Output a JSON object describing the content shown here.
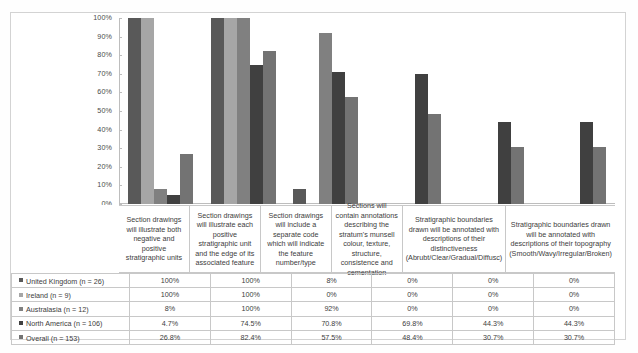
{
  "chart_data": {
    "type": "bar",
    "title": "",
    "xlabel": "",
    "ylabel": "",
    "ylim": [
      0,
      100
    ],
    "grid": false,
    "legend_position": "table-left-column",
    "y_ticks": [
      "0%",
      "10%",
      "20%",
      "30%",
      "40%",
      "50%",
      "60%",
      "70%",
      "80%",
      "90%",
      "100%"
    ],
    "categories": [
      "Section drawings will illustrate both negative and positive stratigraphic units",
      "Section drawings will illustrate each positive stratigraphic unit and the edge of its associated feature",
      "Section drawings will include a separate code which will indicate the feature number/type",
      "Sections will contain annotations describing the stratum's munsell colour, texture, structure, consistence and cementation",
      "Stratigraphic boundaries drawn will be annotated with descriptions of their distinctiveness (Abrubt/Clear/Gradual/Diffusc)",
      "Stratigraphic boundaries drawn will be annotated with descriptions of their topography (Smooth/Wavy/Irregular/Broken)"
    ],
    "series": [
      {
        "name": "United Kingdom (n = 26)",
        "color": "#595959",
        "values": [
          100,
          100,
          8,
          0,
          0,
          0
        ],
        "labels": [
          "100%",
          "100%",
          "8%",
          "0%",
          "0%",
          "0%"
        ]
      },
      {
        "name": "Ireland (n = 9)",
        "color": "#a6a6a6",
        "values": [
          100,
          100,
          0,
          0,
          0,
          0
        ],
        "labels": [
          "100%",
          "100%",
          "0%",
          "0%",
          "0%",
          "0%"
        ]
      },
      {
        "name": "Australasia (n = 12)",
        "color": "#808080",
        "values": [
          8,
          100,
          92,
          0,
          0,
          0
        ],
        "labels": [
          "8%",
          "100%",
          "92%",
          "0%",
          "0%",
          "0%"
        ]
      },
      {
        "name": "North America (n = 106)",
        "color": "#404040",
        "values": [
          4.7,
          74.5,
          70.8,
          69.8,
          44.3,
          44.3
        ],
        "labels": [
          "4.7%",
          "74.5%",
          "70.8%",
          "69.8%",
          "44.3%",
          "44.3%"
        ]
      },
      {
        "name": "Overall (n = 153)",
        "color": "#737373",
        "values": [
          26.8,
          82.4,
          57.5,
          48.4,
          30.7,
          30.7
        ],
        "labels": [
          "26.8%",
          "82.4%",
          "57.5%",
          "48.4%",
          "30.7%",
          "30.7%"
        ]
      }
    ]
  }
}
